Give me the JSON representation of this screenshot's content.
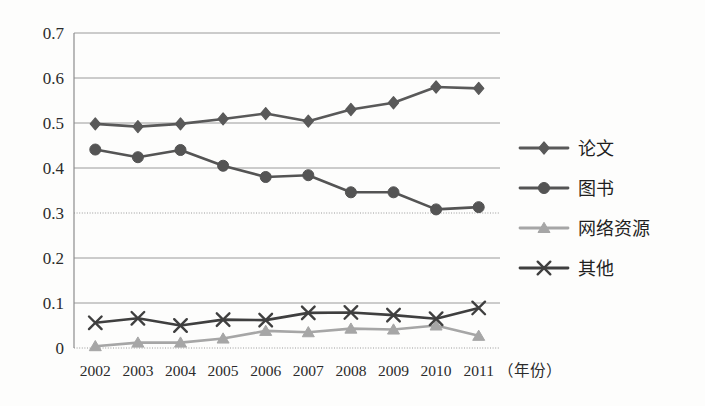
{
  "chart_data": {
    "type": "line",
    "title": "",
    "xlabel": "（年份）",
    "ylabel": "",
    "categories": [
      "2002",
      "2003",
      "2004",
      "2005",
      "2006",
      "2007",
      "2008",
      "2009",
      "2010",
      "2011"
    ],
    "ylim": [
      0,
      0.7
    ],
    "ytick_labels": [
      "0",
      "0.1",
      "0.2",
      "0.3",
      "0.4",
      "0.5",
      "0.6",
      "0.7"
    ],
    "ytick_values": [
      0,
      0.1,
      0.2,
      0.3,
      0.4,
      0.5,
      0.6,
      0.7
    ],
    "grid": true,
    "legend_position": "right",
    "series": [
      {
        "name": "论文",
        "marker": "diamond",
        "color": "#595959",
        "values": [
          0.498,
          0.492,
          0.498,
          0.509,
          0.521,
          0.504,
          0.53,
          0.545,
          0.58,
          0.577
        ]
      },
      {
        "name": "图书",
        "marker": "circle",
        "color": "#545454",
        "values": [
          0.441,
          0.424,
          0.44,
          0.405,
          0.38,
          0.384,
          0.346,
          0.346,
          0.308,
          0.313
        ]
      },
      {
        "name": "网络资源",
        "marker": "triangle",
        "color": "#a6a6a6",
        "values": [
          0.004,
          0.012,
          0.012,
          0.021,
          0.038,
          0.035,
          0.043,
          0.041,
          0.05,
          0.027
        ]
      },
      {
        "name": "其他",
        "marker": "x",
        "color": "#3f3f3f",
        "values": [
          0.056,
          0.066,
          0.05,
          0.063,
          0.062,
          0.078,
          0.079,
          0.073,
          0.065,
          0.089
        ]
      }
    ]
  },
  "legend": {
    "items": [
      {
        "label": "论文"
      },
      {
        "label": "图书"
      },
      {
        "label": "网络资源"
      },
      {
        "label": "其他"
      }
    ]
  },
  "axis": {
    "x_title": "（年份）"
  },
  "colors": {
    "series_paper": "#595959",
    "series_book": "#545454",
    "series_web": "#a6a6a6",
    "series_other": "#3f3f3f",
    "grid": "#9a9a9a",
    "text": "#2b2b2b",
    "background": "#fdfdfc"
  }
}
